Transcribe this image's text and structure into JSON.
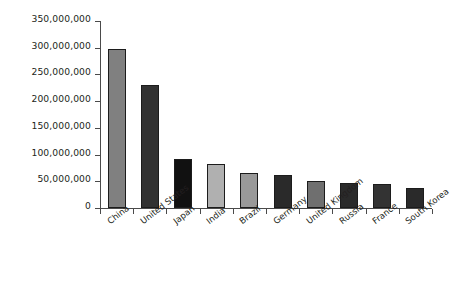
{
  "chart_data": {
    "type": "bar",
    "title": "",
    "subtitle": "",
    "xlabel": "",
    "ylabel": "",
    "categories": [
      "China",
      "United States",
      "Japan",
      "India",
      "Brazil",
      "Germany",
      "United Kingdom",
      "Russia",
      "France",
      "South Korea"
    ],
    "values": [
      298000000,
      230000000,
      92000000,
      82000000,
      65000000,
      62000000,
      50000000,
      47000000,
      45000000,
      38000000
    ],
    "bar_colors": [
      "#808080",
      "#323232",
      "#111111",
      "#b0b0b0",
      "#999999",
      "#2a2a2a",
      "#6f6f6f",
      "#2a2a2a",
      "#333333",
      "#2a2a2a"
    ],
    "ylim": [
      0,
      350000000
    ],
    "ytick_values": [
      0,
      50000000,
      100000000,
      150000000,
      200000000,
      250000000,
      300000000,
      350000000
    ],
    "ytick_labels": [
      "0",
      "50,000,000",
      "100,000,000",
      "150,000,000",
      "200,000,000",
      "250,000,000",
      "300,000,000",
      "350,000,000"
    ],
    "grid": false,
    "legend": false,
    "legend_position": "none",
    "axis_color": "#4a4a4a",
    "background_color": "#ffffff"
  }
}
